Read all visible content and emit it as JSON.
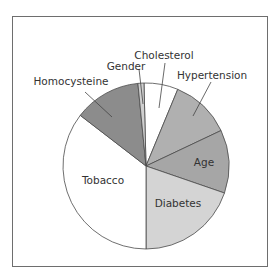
{
  "chart_data": {
    "type": "pie",
    "title": "",
    "categories": [
      "Cholesterol",
      "Hypertension",
      "Age",
      "Diabetes",
      "Tobacco",
      "Homocysteine",
      "Gender"
    ],
    "values": [
      7,
      12,
      12,
      20,
      35,
      13,
      1
    ],
    "start_angles_deg": [
      -1.4,
      22.5,
      64.7,
      109,
      180,
      307.6,
      354.4
    ],
    "end_angles_deg": [
      22.5,
      64.7,
      109,
      180,
      307.6,
      354.4,
      358.6
    ],
    "colors": [
      "#ffffff",
      "#b0b0b0",
      "#a6a6a6",
      "#d4d4d4",
      "#ffffff",
      "#8c8c8c",
      "#cfcfcf"
    ],
    "legend": "none (direct labels)",
    "center": [
      146,
      166
    ],
    "radius": 83
  },
  "labels": {
    "cholesterol": "Cholesterol",
    "hypertension": "Hypertension",
    "age": "Age",
    "diabetes": "Diabetes",
    "tobacco": "Tobacco",
    "homocysteine": "Homocysteine",
    "gender": "Gender"
  }
}
